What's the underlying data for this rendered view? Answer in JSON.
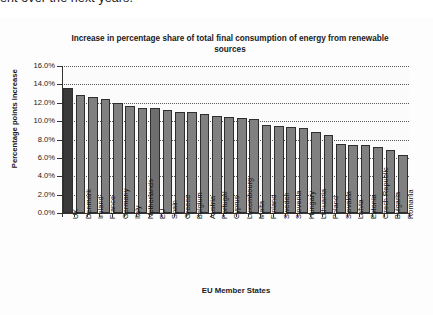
{
  "document": {
    "cut_off_line": "ent over the next years."
  },
  "chart_data": {
    "type": "bar",
    "title": "Increase in percentage share of total final consumption of energy from renewable sources",
    "xlabel": "EU Member States",
    "ylabel": "Percentage points increase",
    "ylim": [
      0,
      16
    ],
    "ytick_labels": [
      "16.0%",
      "14.0%",
      "12.0%",
      "10.0%",
      "8.0%",
      "6.0%",
      "4.0%",
      "2.0%",
      "0.0%"
    ],
    "ytick_values": [
      16,
      14,
      12,
      10,
      8,
      6,
      4,
      2,
      0
    ],
    "grid": true,
    "legend": "none",
    "categories": [
      "UK",
      "Denmark",
      "Ireland",
      "France",
      "Germany",
      "Italy",
      "Netherlands",
      "EU",
      "Spain",
      "Greece",
      "Belgium",
      "Austria",
      "Portugal",
      "Cyprus",
      "Luxembourg",
      "Malta",
      "Finland",
      "Sweden",
      "Slovenia",
      "Hungary",
      "Lithuania",
      "Poland",
      "Slovakia",
      "Latvia",
      "Estonia",
      "Czech Republic",
      "Bulgaria",
      "Romania"
    ],
    "values": [
      13.6,
      12.8,
      12.6,
      12.4,
      12.0,
      11.6,
      11.4,
      11.4,
      11.2,
      11.0,
      11.0,
      10.8,
      10.6,
      10.4,
      10.3,
      10.2,
      9.6,
      9.5,
      9.4,
      9.2,
      8.8,
      8.5,
      7.5,
      7.4,
      7.4,
      7.2,
      6.9,
      6.3
    ],
    "highlight_indices": [
      0,
      7
    ],
    "colors": {
      "bar_default": "#808080",
      "bar_highlight_primary": "#3a3a3a",
      "bar_highlight_secondary": "#6e6e6e",
      "bar_border": "#2e2e2e",
      "axis": "#333333",
      "gridline": "#5a5a5a",
      "text": "#1a1a1a",
      "plot_background": "#fbfbfb"
    }
  }
}
